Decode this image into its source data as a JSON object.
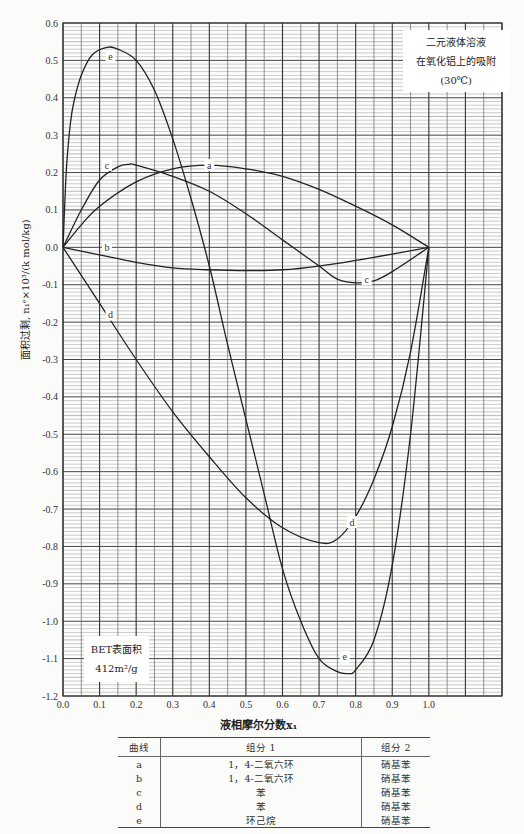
{
  "chart_data": {
    "type": "line",
    "title_lines": [
      "二元液体溶液",
      "在氧化铝上的吸附",
      "(30℃)"
    ],
    "annotation_lines": [
      "BET表面积",
      "412m²/g"
    ],
    "xlabel": "液相摩尔分数x₁",
    "ylabel": "面积过剩, n₁ᵉ×10³/(k mol/kg)",
    "xlim": [
      0,
      1.2
    ],
    "ylim": [
      -1.2,
      0.6
    ],
    "x_ticks": [
      "0.0",
      "0.1",
      "0.2",
      "0.3",
      "0.4",
      "0.5",
      "0.6",
      "0.7",
      "0.8",
      "0.9",
      "1.0"
    ],
    "y_ticks": [
      "0.6",
      "0.5",
      "0.4",
      "0.3",
      "0.2",
      "0.1",
      "0.0",
      "-0.1",
      "-0.2",
      "-0.3",
      "-0.4",
      "-0.5",
      "-0.6",
      "-0.7",
      "-0.8",
      "-0.9",
      "-1.0",
      "-1.1",
      "-1.2"
    ],
    "grid": true,
    "series": [
      {
        "name": "a",
        "label_at": [
          0.4,
          0.22
        ],
        "x": [
          0,
          0.05,
          0.1,
          0.2,
          0.3,
          0.4,
          0.5,
          0.6,
          0.7,
          0.8,
          0.9,
          1.0
        ],
        "y": [
          0,
          0.06,
          0.11,
          0.175,
          0.21,
          0.22,
          0.21,
          0.19,
          0.155,
          0.11,
          0.06,
          0
        ]
      },
      {
        "name": "b",
        "label_at": [
          0.12,
          0.0
        ],
        "x": [
          0,
          0.1,
          0.2,
          0.3,
          0.4,
          0.5,
          0.6,
          0.7,
          0.8,
          0.9,
          1.0
        ],
        "y": [
          0,
          -0.02,
          -0.04,
          -0.055,
          -0.06,
          -0.062,
          -0.06,
          -0.05,
          -0.035,
          -0.018,
          0
        ]
      },
      {
        "name": "c",
        "label_at": [
          0.12,
          0.22
        ],
        "label2_at": [
          0.83,
          -0.085
        ],
        "x": [
          0,
          0.05,
          0.1,
          0.15,
          0.18,
          0.2,
          0.3,
          0.4,
          0.5,
          0.6,
          0.7,
          0.75,
          0.8,
          0.85,
          0.9,
          1.0
        ],
        "y": [
          0,
          0.1,
          0.18,
          0.215,
          0.222,
          0.22,
          0.19,
          0.15,
          0.09,
          0.02,
          -0.05,
          -0.085,
          -0.095,
          -0.09,
          -0.065,
          0
        ]
      },
      {
        "name": "d",
        "label_at": [
          0.13,
          -0.18
        ],
        "label2_at": [
          0.79,
          -0.735
        ],
        "x": [
          0,
          0.1,
          0.2,
          0.3,
          0.4,
          0.5,
          0.6,
          0.7,
          0.75,
          0.8,
          0.85,
          0.9,
          0.95,
          1.0
        ],
        "y": [
          0,
          -0.15,
          -0.3,
          -0.44,
          -0.56,
          -0.67,
          -0.75,
          -0.79,
          -0.78,
          -0.72,
          -0.62,
          -0.48,
          -0.28,
          0
        ]
      },
      {
        "name": "e",
        "label_at": [
          0.13,
          0.51
        ],
        "label2_at": [
          0.77,
          -1.095
        ],
        "x": [
          0,
          0.005,
          0.01,
          0.02,
          0.03,
          0.05,
          0.08,
          0.12,
          0.15,
          0.2,
          0.25,
          0.3,
          0.35,
          0.4,
          0.45,
          0.5,
          0.55,
          0.6,
          0.65,
          0.7,
          0.75,
          0.78,
          0.8,
          0.85,
          0.9,
          0.95,
          1.0
        ],
        "y": [
          0,
          0.12,
          0.22,
          0.33,
          0.39,
          0.46,
          0.515,
          0.535,
          0.53,
          0.5,
          0.42,
          0.29,
          0.13,
          -0.05,
          -0.26,
          -0.46,
          -0.66,
          -0.86,
          -1.0,
          -1.1,
          -1.135,
          -1.14,
          -1.13,
          -1.05,
          -0.85,
          -0.5,
          0
        ]
      }
    ]
  },
  "legend_table": {
    "headers": [
      "曲线",
      "组分 1",
      "组分 2"
    ],
    "rows": [
      [
        "a",
        "1，4-二氧六环",
        "硝基苯"
      ],
      [
        "b",
        "1，4-二氧六环",
        "硝基苯"
      ],
      [
        "c",
        "苯",
        "硝基苯"
      ],
      [
        "d",
        "苯",
        "硝基苯"
      ],
      [
        "e",
        "环己烷",
        "硝基苯"
      ]
    ]
  }
}
